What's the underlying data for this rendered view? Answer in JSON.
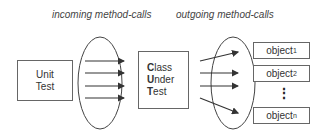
{
  "labels": {
    "incoming": "incoming method-calls",
    "outgoing": "outgoing method-calls"
  },
  "unit_test": {
    "line1": "Unit",
    "line2": "Test"
  },
  "cut": {
    "line1_bold": "C",
    "line1_rest": "lass",
    "line2_bold": "U",
    "line2_rest": "nder",
    "line3_bold": "T",
    "line3_rest": "est"
  },
  "objects": [
    {
      "name": "object",
      "sub": "1"
    },
    {
      "name": "object",
      "sub": "2"
    },
    {
      "name": "object",
      "sub": "n"
    }
  ],
  "ellipsis": "⋮"
}
